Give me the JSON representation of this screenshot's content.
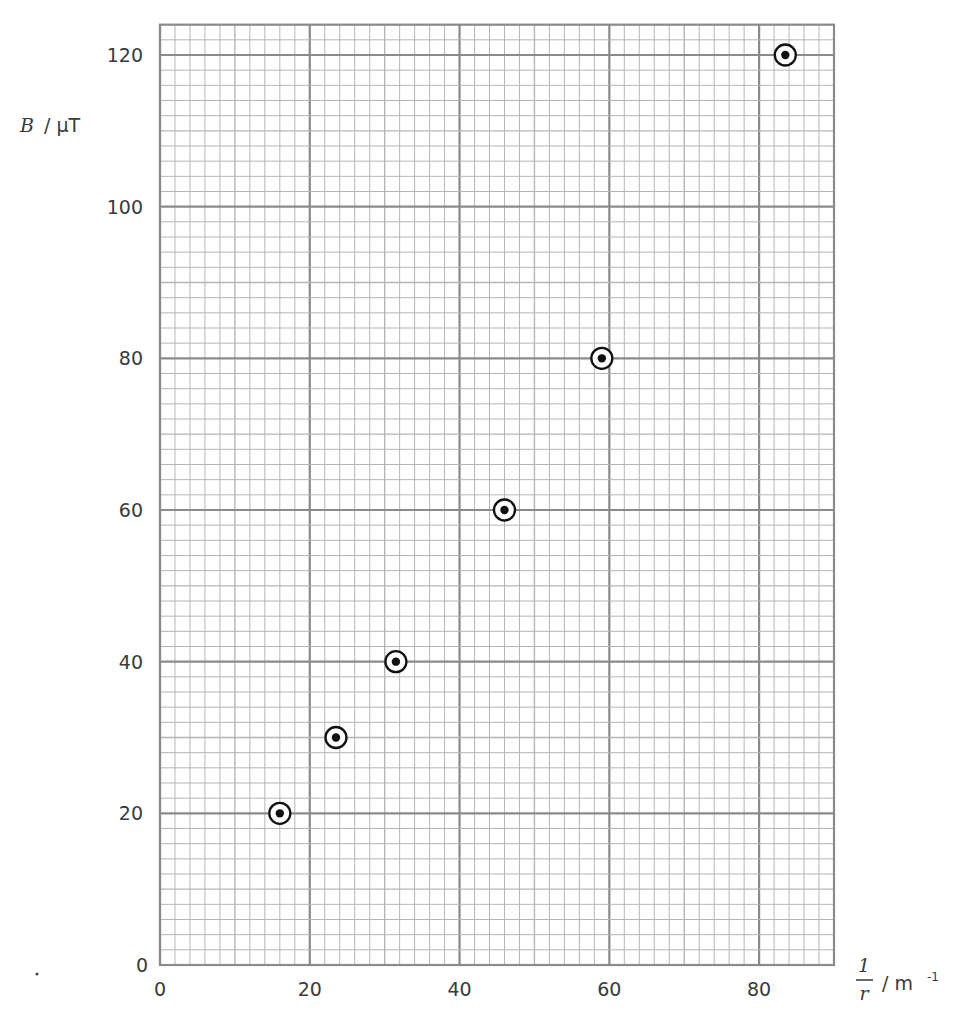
{
  "chart_data": {
    "type": "scatter",
    "title": "",
    "xlabel": "1/r / m⁻¹",
    "ylabel": "B / μT",
    "xlabel_parts": {
      "numerator": "1",
      "denominator": "r",
      "unit": "/ m",
      "unit_sup": "-1"
    },
    "ylabel_parts": {
      "symbol": "B",
      "unit": "/ μT"
    },
    "xlim": [
      0,
      90
    ],
    "ylim": [
      0,
      124
    ],
    "x_ticks": [
      0,
      20,
      40,
      60,
      80
    ],
    "y_ticks": [
      0,
      20,
      40,
      60,
      80,
      100,
      120
    ],
    "grid": {
      "on": true,
      "minor_x_step": 2,
      "minor_y_step": 2,
      "medium_x_step": 10,
      "medium_y_step": 10,
      "major_x_step": 20,
      "major_y_step": 20
    },
    "marker": "circled-dot",
    "series": [
      {
        "name": "B vs 1/r",
        "x": [
          16,
          23.5,
          31.5,
          46,
          59,
          83.5
        ],
        "y": [
          20,
          30,
          40,
          60,
          80,
          120
        ]
      }
    ]
  },
  "colors": {
    "grid_minor": "#b5b5b5",
    "grid_major": "#8a8a8a",
    "marker": "#111111",
    "text": "#3a3a3a"
  }
}
